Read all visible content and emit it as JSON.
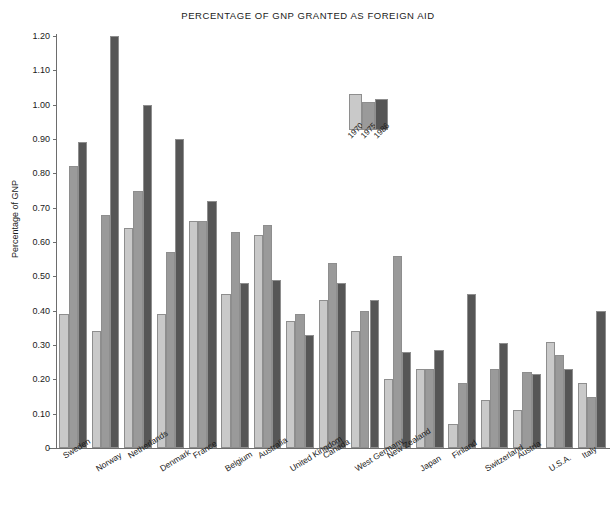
{
  "chart_data": {
    "type": "bar",
    "title": "PERCENTAGE OF GNP GRANTED AS FOREIGN AID",
    "xlabel": "",
    "ylabel": "Percentage of GNP",
    "ylim": [
      0,
      1.2
    ],
    "ytick_labels": [
      "0",
      "0.10",
      "0.20",
      "0.30",
      "0.40",
      "0.50",
      "0.60",
      "0.70",
      "0.80",
      "0.90",
      "1.00",
      "1.10",
      "1.20"
    ],
    "ytick_values": [
      0,
      0.1,
      0.2,
      0.3,
      0.4,
      0.5,
      0.6,
      0.7,
      0.8,
      0.9,
      1.0,
      1.1,
      1.2
    ],
    "grid": false,
    "legend_position": "upper-center",
    "categories": [
      "Sweden",
      "Norway",
      "Netherlands",
      "Denmark",
      "France",
      "Belgium",
      "Australia",
      "United Kingdom",
      "Canada",
      "West Germany",
      "New Zealand",
      "Japan",
      "Finland",
      "Switzerland",
      "Austria",
      "U.S.A.",
      "Italy"
    ],
    "series": [
      {
        "name": "1970",
        "color": "#c9c9c9",
        "values": [
          0.39,
          0.34,
          0.64,
          0.39,
          0.66,
          0.45,
          0.62,
          0.37,
          0.43,
          0.34,
          0.2,
          0.23,
          0.07,
          0.14,
          0.11,
          0.31,
          0.19
        ]
      },
      {
        "name": "1975",
        "color": "#9a9a9a",
        "values": [
          0.82,
          0.68,
          0.75,
          0.57,
          0.66,
          0.63,
          0.65,
          0.39,
          0.54,
          0.4,
          0.56,
          0.23,
          0.19,
          0.23,
          0.22,
          0.27,
          0.15
        ]
      },
      {
        "name": "1986",
        "color": "#565656",
        "values": [
          0.89,
          1.2,
          1.0,
          0.9,
          0.72,
          0.48,
          0.49,
          0.33,
          0.48,
          0.43,
          0.28,
          0.285,
          0.45,
          0.305,
          0.215,
          0.23,
          0.4
        ]
      }
    ]
  }
}
